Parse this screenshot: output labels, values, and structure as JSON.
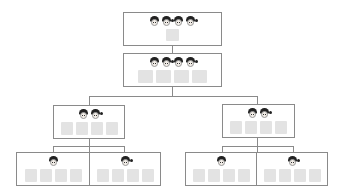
{
  "diagram": {
    "type": "tree",
    "colors": {
      "border": "#8a8a8a",
      "cell": "#e3e3e3",
      "hair": "#222222",
      "skin": "#f1ece6"
    },
    "nodes": [
      {
        "id": "root",
        "level": 0,
        "faces": [
          "boy",
          "girl",
          "boy",
          "girl"
        ],
        "cells": 1
      },
      {
        "id": "level1",
        "level": 1,
        "faces": [
          "boy",
          "girl",
          "boy",
          "girl"
        ],
        "cells": 4
      },
      {
        "id": "left",
        "level": 2,
        "faces": [
          "boy",
          "girl"
        ],
        "cells": 4
      },
      {
        "id": "right",
        "level": 2,
        "faces": [
          "boy",
          "girl"
        ],
        "cells": 4
      },
      {
        "id": "left-boy",
        "level": 3,
        "faces": [
          "boy"
        ],
        "cells": 4
      },
      {
        "id": "left-girl",
        "level": 3,
        "faces": [
          "girl"
        ],
        "cells": 4
      },
      {
        "id": "right-boy",
        "level": 3,
        "faces": [
          "boy"
        ],
        "cells": 4
      },
      {
        "id": "right-girl",
        "level": 3,
        "faces": [
          "girl"
        ],
        "cells": 4
      }
    ]
  }
}
